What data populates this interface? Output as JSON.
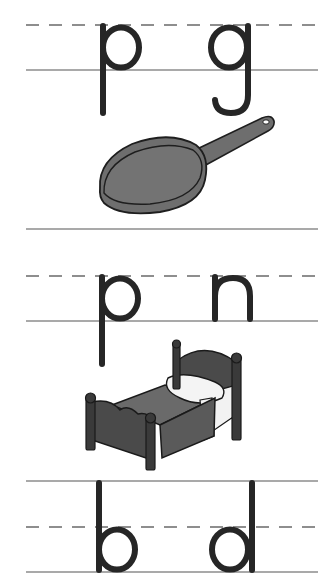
{
  "worksheet": {
    "type": "letter-pair writing practice",
    "colors": {
      "background": "#ffffff",
      "guide_line": "#8c8c8c",
      "dashed_midline": "#6a6a6a",
      "letter_ink": "#262626",
      "picture_fill_dark": "#4a4a4a",
      "picture_fill_mid": "#6e6e6e",
      "picture_fill_light": "#f2f2f2"
    },
    "rows": [
      {
        "letters": [
          "p",
          "g"
        ],
        "picture": {
          "name": "frying-pan",
          "label": "frying pan"
        }
      },
      {
        "letters": [
          "p",
          "n"
        ],
        "picture": {
          "name": "bed",
          "label": "bed"
        }
      },
      {
        "letters": [
          "b",
          "d"
        ],
        "picture": null
      }
    ]
  }
}
